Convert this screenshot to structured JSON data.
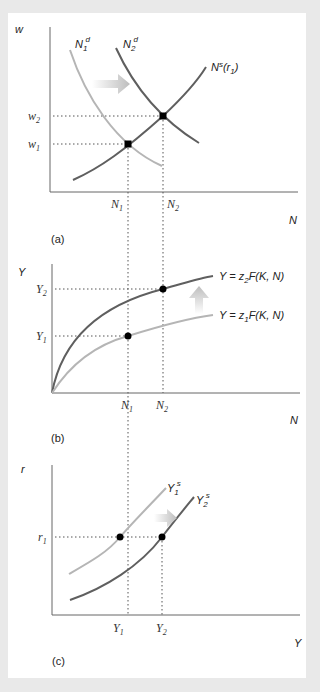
{
  "figure": {
    "panel_a": {
      "label": "(a)",
      "y_axis_label": "w",
      "x_axis_label": "N",
      "y_ticks": [
        {
          "base": "w",
          "sub": "2"
        },
        {
          "base": "w",
          "sub": "1"
        }
      ],
      "x_ticks": [
        {
          "base": "N",
          "sub": "1"
        },
        {
          "base": "N",
          "sub": "2"
        }
      ],
      "curves": [
        {
          "name": "N1d",
          "base": "N",
          "sub": "1",
          "sup": "d",
          "color": "#b5b5b5"
        },
        {
          "name": "N2d",
          "base": "N",
          "sub": "2",
          "sup": "d",
          "color": "#5f5f5f"
        },
        {
          "name": "Ns(r1)",
          "base": "N",
          "sup": "s",
          "suffix_open": "(r",
          "suffix_sub": "1",
          "suffix_close": ")",
          "color": "#5f5f5f"
        }
      ],
      "shift_arrow": "right"
    },
    "panel_b": {
      "label": "(b)",
      "y_axis_label": "Y",
      "x_axis_label": "N",
      "y_ticks": [
        {
          "base": "Y",
          "sub": "2"
        },
        {
          "base": "Y",
          "sub": "1"
        }
      ],
      "x_ticks": [
        {
          "base": "N",
          "sub": "1"
        },
        {
          "base": "N",
          "sub": "2"
        }
      ],
      "curves": [
        {
          "name": "Y = z2F(K, N)",
          "pre": "Y = z",
          "sub": "2",
          "post": "F(K, N)",
          "color": "#5f5f5f"
        },
        {
          "name": "Y = z1F(K, N)",
          "pre": "Y = z",
          "sub": "1",
          "post": "F(K, N)",
          "color": "#b5b5b5"
        }
      ],
      "shift_arrow": "up"
    },
    "panel_c": {
      "label": "(c)",
      "y_axis_label": "r",
      "x_axis_label": "Y",
      "y_ticks": [
        {
          "base": "r",
          "sub": "1"
        }
      ],
      "x_ticks": [
        {
          "base": "Y",
          "sub": "1"
        },
        {
          "base": "Y",
          "sub": "2"
        }
      ],
      "curves": [
        {
          "name": "Y1s",
          "base": "Y",
          "sub": "1",
          "sup": "s",
          "color": "#b5b5b5"
        },
        {
          "name": "Y2s",
          "base": "Y",
          "sub": "2",
          "sup": "s",
          "color": "#5f5f5f"
        }
      ],
      "shift_arrow": "right"
    },
    "colors": {
      "dark_curve": "#5f5f5f",
      "light_curve": "#b5b5b5",
      "axis": "#666666",
      "point": "#000000",
      "arrow": "#c8c8c8"
    }
  }
}
